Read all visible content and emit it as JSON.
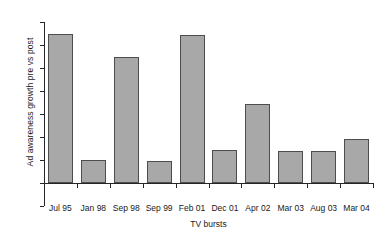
{
  "chart_data": {
    "type": "bar",
    "title": "",
    "subtitle": "",
    "xlabel": "TV bursts",
    "ylabel": "Ad awareness growth pre vs post",
    "categories": [
      "Jul 95",
      "Jan 98",
      "Sep 98",
      "Sep 99",
      "Feb 01",
      "Dec 01",
      "Apr 02",
      "Mar 03",
      "Aug 03",
      "Mar 04"
    ],
    "values": [
      13,
      2,
      11,
      1.9,
      12.9,
      2.85,
      6.85,
      2.8,
      2.75,
      3.8
    ],
    "ylim": [
      -2,
      14
    ],
    "ytick_labels": [
      "14",
      "12",
      "10",
      "8",
      "6",
      "4",
      "2",
      "0",
      "-2"
    ],
    "ytick_values": [
      14,
      12,
      10,
      8,
      6,
      4,
      2,
      0,
      -2
    ],
    "grid": false,
    "legend": null,
    "bar_color": "#a8a8a8",
    "bar_border_color": "#4d4d4d",
    "axis_color": "#262626",
    "annotations": []
  }
}
